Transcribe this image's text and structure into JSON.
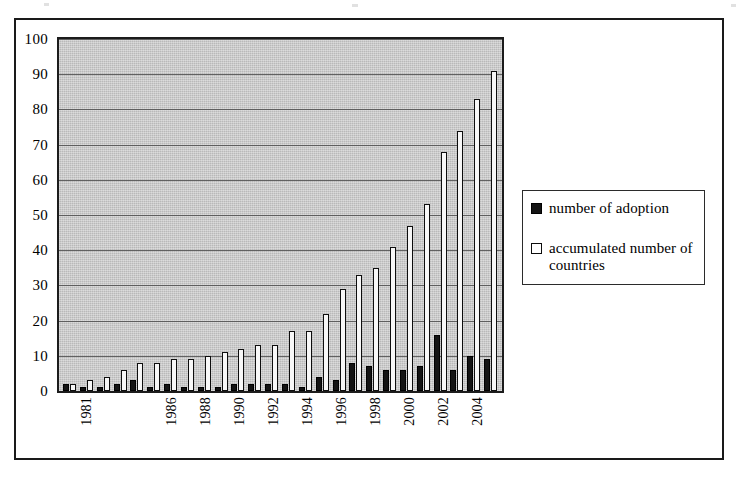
{
  "figure": {
    "legend": {
      "entries": [
        {
          "label": "number of adoption",
          "swatch": "filled-black-square",
          "color": "#141414"
        },
        {
          "label": "accumulated number of countries",
          "swatch": "open-white-square",
          "color": "#ffffff"
        }
      ]
    }
  },
  "chart_data": {
    "type": "bar",
    "title": "",
    "subtitle": "",
    "xlabel": "",
    "ylabel": "",
    "ylim": [
      0,
      100
    ],
    "ytick_labels": [
      "100",
      "90",
      "80",
      "70",
      "60",
      "50",
      "40",
      "30",
      "20",
      "10",
      "0"
    ],
    "ytick_values": [
      100,
      90,
      80,
      70,
      60,
      50,
      40,
      30,
      20,
      10,
      0
    ],
    "grid": true,
    "legend_position": "right",
    "categories": [
      "1980",
      "1981",
      "1982",
      "1983",
      "1984",
      "1985",
      "1986",
      "1987",
      "1988",
      "1989",
      "1990",
      "1991",
      "1992",
      "1993",
      "1994",
      "1995",
      "1996",
      "1997",
      "1998",
      "1999",
      "2000",
      "2001",
      "2002",
      "2003",
      "2004",
      "2005"
    ],
    "xtick_labels": [
      "",
      "1981",
      "",
      "",
      "",
      "",
      "1986",
      "",
      "1988",
      "",
      "1990",
      "",
      "1992",
      "",
      "1994",
      "",
      "1996",
      "",
      "1998",
      "",
      "2000",
      "",
      "2002",
      "",
      "2004",
      ""
    ],
    "series": [
      {
        "name": "number of adoption",
        "color": "#141414",
        "values": [
          2,
          1,
          1,
          2,
          3,
          1,
          2,
          1,
          1,
          1,
          2,
          2,
          2,
          2,
          1,
          4,
          3,
          8,
          7,
          6,
          6,
          7,
          16,
          6,
          10,
          9
        ]
      },
      {
        "name": "accumulated number of countries",
        "color": "#ffffff",
        "values": [
          2,
          3,
          4,
          6,
          8,
          8,
          9,
          9,
          10,
          11,
          12,
          13,
          13,
          17,
          17,
          22,
          29,
          33,
          35,
          41,
          47,
          53,
          68,
          74,
          83,
          91
        ]
      }
    ]
  }
}
